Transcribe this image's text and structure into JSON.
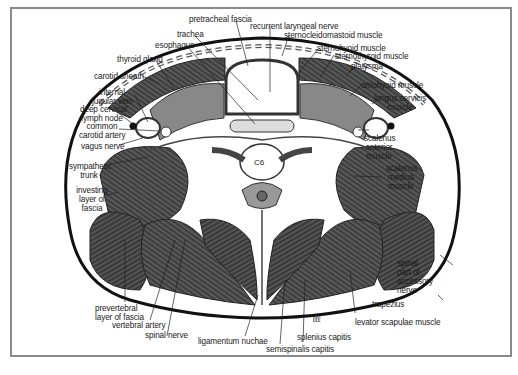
{
  "figure": {
    "vertebra_label": "C6",
    "artist_mark": "ℓℓℓ",
    "labels": {
      "pretracheal_fascia": "pretracheal fascia",
      "recurrent_laryngeal_nerve": "recurrent laryngeal nerve",
      "trachea": "trachea",
      "esophagus": "esophagus",
      "sternocleidomastoid_muscle": "sternocleidomastoid muscle",
      "sternohyoid_muscle": "sternohyoid muscle",
      "sternothyroid_muscle": "sternothyroid muscle",
      "thyroid_gland": "thyroid gland",
      "platysma": "platysma",
      "carotid_sheath": "carotid sheath",
      "omohyoid_muscle": "omohyoid muscle",
      "internal_jugular_vein_1": "internal",
      "internal_jugular_vein_2": "jugular vein",
      "longus_cervicis_1": "longus cervicis",
      "longus_cervicis_2": "muscle",
      "deep_cervical_lymph_node_1": "deep cervical",
      "deep_cervical_lymph_node_2": "lymph node",
      "common_carotid_artery_1": "common",
      "common_carotid_artery_2": "carotid artery",
      "vagus_nerve": "vagus nerve",
      "scalenus_anterior_1": "scalenus",
      "scalenus_anterior_2": "anterior",
      "scalenus_anterior_3": "muscle",
      "sympathetic_trunk_1": "sympathetic",
      "sympathetic_trunk_2": "trunk",
      "scalenus_medius_1": "scalenus",
      "scalenus_medius_2": "medius",
      "scalenus_medius_3": "muscle",
      "investing_layer_1": "investing",
      "investing_layer_2": "layer of",
      "investing_layer_3": "fascia",
      "spinal_accessory_1": "spinal",
      "spinal_accessory_2": "part of",
      "spinal_accessory_3": "accessory",
      "spinal_accessory_4": "nerve",
      "trapezius": "trapezius",
      "prevertebral_1": "prevertebral",
      "prevertebral_2": "layer of fascia",
      "vertebral_artery": "vertebral artery",
      "levator_scapulae_muscle": "levator scapulae muscle",
      "spinal_nerve": "spinal nerve",
      "ligamentum_nuchae": "ligamentum nuchae",
      "splenius_capitis": "splenius capitis",
      "semispinalis_capitis": "semispinalis capitis"
    }
  }
}
